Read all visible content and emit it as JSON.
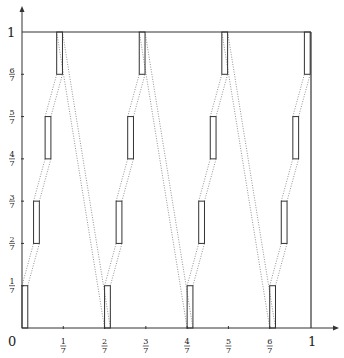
{
  "diagram": {
    "axes": {
      "origin_label": "0",
      "x_ticks": [
        {
          "num": "1",
          "den": "7",
          "value": 0.142857
        },
        {
          "num": "2",
          "den": "7",
          "value": 0.285714
        },
        {
          "num": "3",
          "den": "7",
          "value": 0.428571
        },
        {
          "num": "4",
          "den": "7",
          "value": 0.571429
        },
        {
          "num": "5",
          "den": "7",
          "value": 0.714286
        },
        {
          "num": "6",
          "den": "7",
          "value": 0.857143
        }
      ],
      "x_end_label": "1",
      "y_ticks": [
        {
          "num": "1",
          "den": "7",
          "value": 0.142857
        },
        {
          "num": "2",
          "den": "7",
          "value": 0.285714
        },
        {
          "num": "3",
          "den": "7",
          "value": 0.428571
        },
        {
          "num": "4",
          "den": "7",
          "value": 0.571429
        },
        {
          "num": "5",
          "den": "7",
          "value": 0.714286
        },
        {
          "num": "6",
          "den": "7",
          "value": 0.857143
        }
      ],
      "y_end_label": "1"
    },
    "unit_square": {
      "x": [
        0,
        1
      ],
      "y": [
        0,
        1
      ]
    },
    "rect_width": 0.02,
    "groups": [
      {
        "x0": 0.0
      },
      {
        "x0": 0.285714
      },
      {
        "x0": 0.571429
      },
      {
        "x0": 0.857143
      }
    ],
    "rect_offsets": [
      0.0,
      0.04,
      0.08,
      0.12
    ],
    "rect_levels": [
      {
        "y0": 0.0,
        "y1": 0.142857
      },
      {
        "y0": 0.285714,
        "y1": 0.428571
      },
      {
        "y0": 0.571429,
        "y1": 0.714286
      },
      {
        "y0": 0.857143,
        "y1": 1.0
      }
    ],
    "colors": {
      "line": "#333333",
      "dotted": "#777777",
      "background": "#ffffff"
    }
  }
}
